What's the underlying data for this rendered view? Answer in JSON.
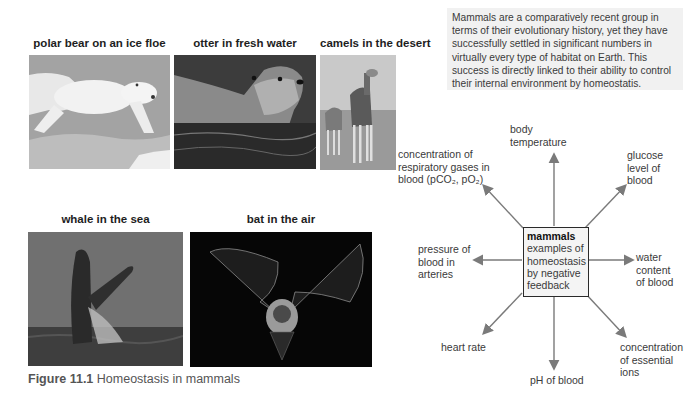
{
  "photos": [
    {
      "id": "polar-bear",
      "label": "polar bear on an ice floe"
    },
    {
      "id": "otter",
      "label": "otter in fresh water"
    },
    {
      "id": "camels",
      "label": "camels in the desert"
    },
    {
      "id": "whale",
      "label": "whale in the sea"
    },
    {
      "id": "bat",
      "label": "bat in the air"
    }
  ],
  "intro_text": "Mammals are a comparatively recent group in terms of their evolutionary history, yet they have successfully settled in significant numbers in virtually every type of habitat on Earth. This success is directly linked to their ability to control their internal environment by homeostatis.",
  "caption": {
    "number": "Figure 11.1",
    "title": "Homeostasis in mammals"
  },
  "diagram": {
    "center": {
      "title": "mammals",
      "body": "examples of homeostasis by negative feedback"
    },
    "labels": {
      "body_temperature": [
        "body",
        "temperature"
      ],
      "respiratory_gases": [
        "concentration of",
        "respiratory gases in",
        "blood (pCO₂, pO₂)"
      ],
      "glucose": [
        "glucose",
        "level of",
        "blood"
      ],
      "blood_pressure": [
        "pressure of",
        "blood in",
        "arteries"
      ],
      "water_content": [
        "water",
        "content",
        "of blood"
      ],
      "heart_rate": [
        "heart rate"
      ],
      "ph": [
        "pH of blood"
      ],
      "ions": [
        "concentration",
        "of essential",
        "ions"
      ]
    }
  },
  "colors": {
    "arrow": "#7a7a7a",
    "box_border": "#2a2a2a",
    "intro_bg": "#f1f1f1"
  }
}
